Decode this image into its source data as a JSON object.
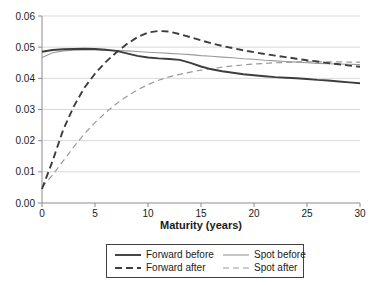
{
  "chart_data": {
    "type": "line",
    "title": "",
    "xlabel": "Maturity (years)",
    "ylabel": "",
    "xlim": [
      0,
      30
    ],
    "ylim": [
      0,
      0.06
    ],
    "xticks": [
      0,
      5,
      10,
      15,
      20,
      25,
      30
    ],
    "yticks": [
      0,
      0.01,
      0.02,
      0.03,
      0.04,
      0.05,
      0.06
    ],
    "ytick_labels": [
      "0.00",
      "0.01",
      "0.02",
      "0.03",
      "0.04",
      "0.05",
      "0.06"
    ],
    "grid": "horizontal",
    "legend_position": "bottom-boxed",
    "colors": {
      "dark_line": "#3d3d3d",
      "light_line": "#9a9a9a",
      "gridline": "#d9d9d9",
      "axis": "#8c8c8c",
      "text": "#1a1a1a"
    },
    "x": [
      0,
      1,
      2,
      3,
      4,
      5,
      6,
      7,
      8,
      9,
      10,
      11,
      12,
      13,
      14,
      15,
      16,
      17,
      18,
      19,
      20,
      21,
      22,
      23,
      24,
      25,
      26,
      27,
      28,
      29,
      30
    ],
    "series": [
      {
        "name": "Forward before",
        "style": "solid-thick-dark",
        "color": "#3d3d3d",
        "width": 1.9,
        "dash": "",
        "values": [
          0.0485,
          0.0491,
          0.0493,
          0.0494,
          0.0495,
          0.0494,
          0.0492,
          0.0488,
          0.048,
          0.0472,
          0.0467,
          0.0464,
          0.0462,
          0.0459,
          0.045,
          0.0438,
          0.0429,
          0.0423,
          0.0418,
          0.0413,
          0.041,
          0.0407,
          0.0404,
          0.0402,
          0.04,
          0.0398,
          0.0395,
          0.0393,
          0.039,
          0.0387,
          0.0384
        ]
      },
      {
        "name": "Spot before",
        "style": "solid-thin-gray",
        "color": "#9a9a9a",
        "width": 1.1,
        "dash": "",
        "values": [
          0.0467,
          0.0482,
          0.0488,
          0.049,
          0.0491,
          0.0491,
          0.049,
          0.0489,
          0.0488,
          0.0486,
          0.0484,
          0.0482,
          0.048,
          0.0478,
          0.0476,
          0.0473,
          0.0471,
          0.0468,
          0.0466,
          0.0463,
          0.0461,
          0.0458,
          0.0456,
          0.0454,
          0.0452,
          0.045,
          0.0448,
          0.0447,
          0.0446,
          0.0445,
          0.0444
        ]
      },
      {
        "name": "Forward after",
        "style": "dashed-thick-dark",
        "color": "#3d3d3d",
        "width": 1.9,
        "dash": "7,4",
        "values": [
          0.0045,
          0.0135,
          0.0235,
          0.031,
          0.037,
          0.0415,
          0.0452,
          0.0483,
          0.051,
          0.0532,
          0.0547,
          0.0552,
          0.055,
          0.0542,
          0.0532,
          0.0522,
          0.0512,
          0.0504,
          0.0497,
          0.049,
          0.0484,
          0.0478,
          0.0473,
          0.0468,
          0.0463,
          0.0458,
          0.0454,
          0.0449,
          0.0445,
          0.0441,
          0.0437
        ]
      },
      {
        "name": "Spot after",
        "style": "dashed-thin-gray",
        "color": "#9a9a9a",
        "width": 1.2,
        "dash": "6,4",
        "values": [
          0.005,
          0.009,
          0.0135,
          0.018,
          0.0222,
          0.0258,
          0.029,
          0.0318,
          0.0342,
          0.0363,
          0.038,
          0.0394,
          0.0405,
          0.0413,
          0.042,
          0.0426,
          0.0431,
          0.0436,
          0.044,
          0.0443,
          0.0446,
          0.0448,
          0.045,
          0.0451,
          0.0452,
          0.0453,
          0.0453,
          0.0453,
          0.0453,
          0.0452,
          0.0452
        ]
      }
    ]
  }
}
